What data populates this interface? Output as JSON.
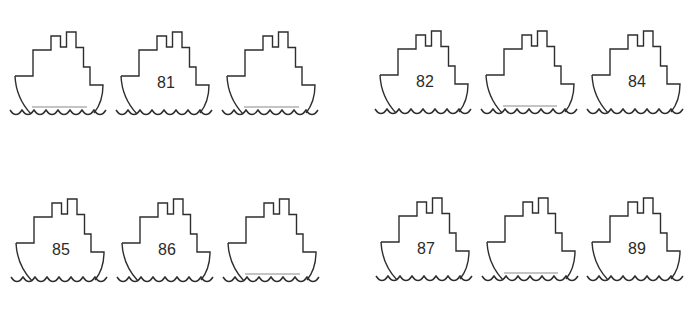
{
  "worksheet": {
    "title": "",
    "colors": {
      "outline": "#2e2e2e",
      "answer_line": "#8a8a8a",
      "background": "#ffffff"
    },
    "rows": [
      {
        "groups": [
          {
            "ships": [
              {
                "number": "",
                "blank": true
              },
              {
                "number": "81",
                "blank": false
              },
              {
                "number": "",
                "blank": true
              }
            ]
          },
          {
            "ships": [
              {
                "number": "82",
                "blank": false
              },
              {
                "number": "",
                "blank": true
              },
              {
                "number": "84",
                "blank": false
              }
            ]
          }
        ]
      },
      {
        "groups": [
          {
            "ships": [
              {
                "number": "85",
                "blank": false
              },
              {
                "number": "86",
                "blank": false
              },
              {
                "number": "",
                "blank": true
              }
            ]
          },
          {
            "ships": [
              {
                "number": "87",
                "blank": false
              },
              {
                "number": "",
                "blank": true
              },
              {
                "number": "89",
                "blank": false
              }
            ]
          }
        ]
      }
    ]
  }
}
